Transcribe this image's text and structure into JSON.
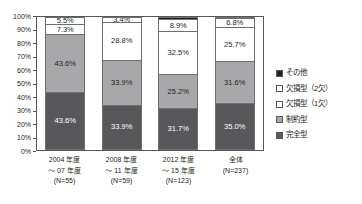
{
  "top_strip_text": "",
  "chart_data": {
    "type": "bar",
    "subtype": "stacked-100-percent",
    "title": "",
    "xlabel": "",
    "ylabel": "",
    "ylim": [
      0,
      100
    ],
    "y_unit": "%",
    "grid": false,
    "legend_position": "right",
    "categories": [
      "2004 年度\n～ 07 年度\n(N=55)",
      "2008 年度\n～ 11 年度\n(N=59)",
      "2012 年度\n～ 15 年度\n(N=123)",
      "全体\n(N=237)"
    ],
    "category_lines": [
      [
        "2004 年度",
        "～ 07 年度",
        "(N=55)"
      ],
      [
        "2008 年度",
        "～ 11 年度",
        "(N=59)"
      ],
      [
        "2012 年度",
        "～ 15 年度",
        "(N=123)"
      ],
      [
        "全体",
        "(N=237)",
        ""
      ]
    ],
    "series": [
      {
        "name": "完全型",
        "color": "#58585b",
        "values": [
          43.6,
          33.9,
          31.7,
          35.0
        ]
      },
      {
        "name": "制約型",
        "color": "#a8a8ab",
        "values": [
          43.6,
          33.9,
          25.2,
          31.6
        ]
      },
      {
        "name": "欠損型（1欠）",
        "color": "#ffffff",
        "values": [
          7.3,
          28.8,
          32.5,
          25.7
        ]
      },
      {
        "name": "欠損型（2欠）",
        "color": "#ffffff",
        "values": [
          5.5,
          3.4,
          8.9,
          6.8
        ]
      },
      {
        "name": "その他",
        "color": "#231f20",
        "values": [
          0.0,
          0.0,
          1.7,
          0.9
        ]
      }
    ],
    "y_ticks": [
      "0%",
      "10%",
      "20%",
      "30%",
      "40%",
      "50%",
      "60%",
      "70%",
      "80%",
      "90%",
      "100%"
    ],
    "value_labels": {
      "bar_1": [
        "43.6%",
        "43.6%",
        "7.3%",
        "5.5%",
        ""
      ],
      "bar_2": [
        "33.9%",
        "33.9%",
        "28.8%",
        "3.4%",
        ""
      ],
      "bar_3": [
        "31.7%",
        "25.2%",
        "32.5%",
        "8.9%",
        ""
      ],
      "bar_4": [
        "35.0%",
        "31.6%",
        "25.7%",
        "6.8%",
        ""
      ]
    }
  },
  "legend": {
    "items": [
      {
        "label": "その他",
        "color": "#231f20"
      },
      {
        "label": "欠損型（2欠）",
        "color": "#ffffff"
      },
      {
        "label": "欠損型（1欠）",
        "color": "#ffffff"
      },
      {
        "label": "制約型",
        "color": "#a8a8ab"
      },
      {
        "label": "完全型",
        "color": "#58585b"
      }
    ]
  }
}
